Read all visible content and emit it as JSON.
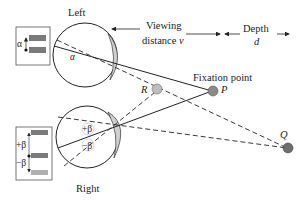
{
  "labels": {
    "left_eye": "Left",
    "right_eye": "Right",
    "viewing_line1": "Viewing",
    "viewing_line2": "distance",
    "viewing_var": "v",
    "depth_line1": "Depth",
    "depth_var": "d",
    "fixation": "Fixation point",
    "point_p": "P",
    "point_r": "R",
    "point_q": "Q",
    "alpha": "α",
    "alpha_inset": "α",
    "plus_beta": "+β",
    "minus_beta": "−β",
    "plus_beta_inset": "+β",
    "minus_beta_inset": "−β"
  },
  "colors": {
    "stroke": "#222222",
    "lens_fill": "#cfcfcf",
    "point_fill": "#8a8a8a",
    "bar_dark": "#7a7a7a",
    "bar_light": "#b0b0b0"
  }
}
